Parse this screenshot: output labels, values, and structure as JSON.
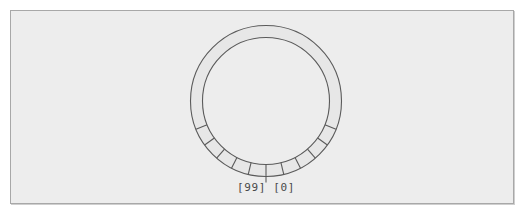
{
  "figure": {
    "name": "circular-ring-buffer-diagram",
    "background_color": "#ffffff",
    "frame": {
      "fill_color": "#ededed",
      "border_color": "#a8a8a8",
      "x": 10,
      "y": 10,
      "width": 504,
      "height": 194
    }
  },
  "ring": {
    "label": "ring-buffer",
    "center_x": 266,
    "center_y": 101,
    "outer_radius": 75.5,
    "inner_radius": 63.5,
    "fill_color": "#e7e7e7",
    "stroke_color": "#5a5a5a",
    "segmented_arc_start_deg": 112,
    "segmented_arc_end_deg": 248,
    "segment_divider_count": 13,
    "segment_divider_spacing_deg": 13.6,
    "top_arc_unsegmented": true
  },
  "labels": {
    "slot_last": "[99]",
    "slot_first": "[0]",
    "combined": "[99] [0]",
    "text_color": "#4a4a4a",
    "position_x": 266,
    "position_y": 191
  },
  "chart_data": {
    "type": "pie",
    "title": "",
    "subtitle": "",
    "xlabel": "",
    "ylabel": "",
    "legend_position": "none",
    "grid": false,
    "total_slots": 100,
    "visible_divider_count": 13,
    "boundary_angle_deg": 180,
    "categories": [
      "[99]",
      "[0]"
    ],
    "values": [
      1,
      1
    ],
    "annotations": [
      {
        "text": "[99]",
        "angle_deg": 184,
        "radius": 88
      },
      {
        "text": "[0]",
        "angle_deg": 176,
        "radius": 88
      }
    ]
  }
}
